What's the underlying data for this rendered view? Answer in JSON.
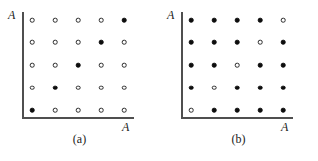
{
  "figure": {
    "background_color": "#ffffff",
    "axis_color": "#4f4f4f",
    "filled_marker_color": "#0d0d0d",
    "open_marker_color": "#ffffff",
    "marker_outline_color": "#2a2a2a"
  },
  "panels": [
    {
      "caption": "(a)",
      "y_axis_label": "A",
      "x_axis_label": "A"
    },
    {
      "caption": "(b)",
      "y_axis_label": "A",
      "x_axis_label": "A"
    }
  ],
  "chart_data": [
    {
      "type": "scatter",
      "title": "(a)",
      "xlabel": "A",
      "ylabel": "A",
      "grid": false,
      "legend": "none",
      "rows": 5,
      "cols": 5,
      "xlim": [
        0,
        6
      ],
      "ylim": [
        0,
        6
      ],
      "x": [
        1,
        2,
        3,
        4,
        5
      ],
      "y": [
        1,
        2,
        3,
        4,
        5
      ],
      "marker_states": [
        [
          "open",
          "open",
          "open",
          "open",
          "filled"
        ],
        [
          "open",
          "open",
          "open",
          "filled",
          "open"
        ],
        [
          "open",
          "open",
          "filled",
          "open",
          "open"
        ],
        [
          "open",
          "filled",
          "open",
          "open",
          "open"
        ],
        [
          "filled",
          "open",
          "open",
          "open",
          "open"
        ]
      ],
      "note": "rows listed top to bottom; filled markers lie on the anti-diagonal running from bottom-left to top-right"
    },
    {
      "type": "scatter",
      "title": "(b)",
      "xlabel": "A",
      "ylabel": "A",
      "grid": false,
      "legend": "none",
      "rows": 5,
      "cols": 5,
      "xlim": [
        0,
        6
      ],
      "ylim": [
        0,
        6
      ],
      "x": [
        1,
        2,
        3,
        4,
        5
      ],
      "y": [
        1,
        2,
        3,
        4,
        5
      ],
      "marker_states": [
        [
          "filled",
          "filled",
          "filled",
          "filled",
          "open"
        ],
        [
          "filled",
          "filled",
          "filled",
          "open",
          "filled"
        ],
        [
          "filled",
          "filled",
          "open",
          "filled",
          "filled"
        ],
        [
          "filled",
          "open",
          "filled",
          "filled",
          "filled"
        ],
        [
          "open",
          "filled",
          "filled",
          "filled",
          "filled"
        ]
      ],
      "note": "rows listed top to bottom; complement of panel (a): open markers lie on the anti-diagonal"
    }
  ]
}
